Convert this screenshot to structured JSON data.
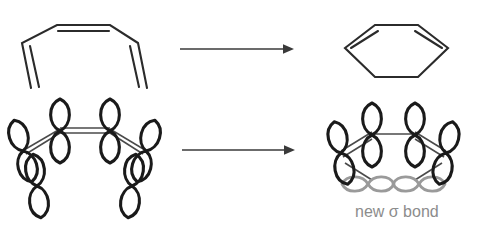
{
  "figure": {
    "background_color": "#ffffff",
    "width": 483,
    "height": 226
  },
  "colors": {
    "bond_black": "#2b2b2b",
    "orbital_black": "#1a1a1a",
    "orbital_gray": "#9a9a9a",
    "label_gray": "#8c8c8c",
    "arrow": "#3a3a3a"
  },
  "rows": [
    {
      "id": "skeletal-row",
      "name": "skeletal-structures",
      "reactant": {
        "name": "hexatriene-skeletal",
        "label": "1,3,5-hexatriene skeletal structure",
        "double_bonds": 3
      },
      "arrow": {
        "name": "reaction-arrow-top",
        "label": "reacts to form",
        "x1": 180,
        "y1": 49,
        "x2": 291,
        "y2": 49
      },
      "product": {
        "name": "cyclohexadiene-skeletal",
        "label": "1,3-cyclohexadiene skeletal structure",
        "double_bonds": 2
      }
    },
    {
      "id": "orbital-row",
      "name": "orbital-diagrams",
      "reactant": {
        "name": "hexatriene-p-orbitals",
        "label": "six p orbitals of hexatriene",
        "orbital_count": 6
      },
      "arrow": {
        "name": "reaction-arrow-bottom",
        "label": "reacts to form",
        "x1": 182,
        "y1": 150,
        "x2": 292,
        "y2": 150
      },
      "product": {
        "name": "cyclohexadiene-p-orbitals",
        "label": "four p orbitals plus new sigma bond",
        "pi_orbital_count": 4,
        "sigma_orbital_count": 2
      }
    }
  ],
  "annotations": {
    "new_sigma_bond": {
      "name": "new-sigma-bond-label",
      "text": "new σ bond",
      "x": 355,
      "y": 212,
      "font_size": 16,
      "color": "#8c8c8c"
    }
  }
}
